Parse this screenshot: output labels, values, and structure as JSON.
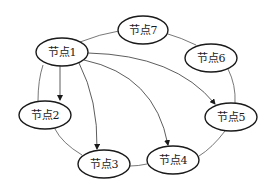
{
  "diagram": {
    "type": "graph",
    "nodes": [
      {
        "id": "n1",
        "label": "节点1",
        "cx": 62,
        "cy": 52
      },
      {
        "id": "n2",
        "label": "节点2",
        "cx": 45,
        "cy": 115
      },
      {
        "id": "n3",
        "label": "节点3",
        "cx": 104,
        "cy": 164
      },
      {
        "id": "n4",
        "label": "节点4",
        "cx": 173,
        "cy": 160
      },
      {
        "id": "n5",
        "label": "节点5",
        "cx": 231,
        "cy": 117
      },
      {
        "id": "n6",
        "label": "节点6",
        "cx": 211,
        "cy": 58
      },
      {
        "id": "n7",
        "label": "节点7",
        "cx": 143,
        "cy": 30
      }
    ],
    "ring_edges": [
      [
        "节点1",
        "节点7"
      ],
      [
        "节点7",
        "节点6"
      ],
      [
        "节点6",
        "节点5"
      ],
      [
        "节点5",
        "节点4"
      ],
      [
        "节点4",
        "节点3"
      ],
      [
        "节点3",
        "节点2"
      ],
      [
        "节点2",
        "节点1"
      ]
    ],
    "directed_edges": [
      [
        "节点1",
        "节点2"
      ],
      [
        "节点1",
        "节点3"
      ],
      [
        "节点1",
        "节点4"
      ],
      [
        "节点1",
        "节点5"
      ]
    ]
  }
}
